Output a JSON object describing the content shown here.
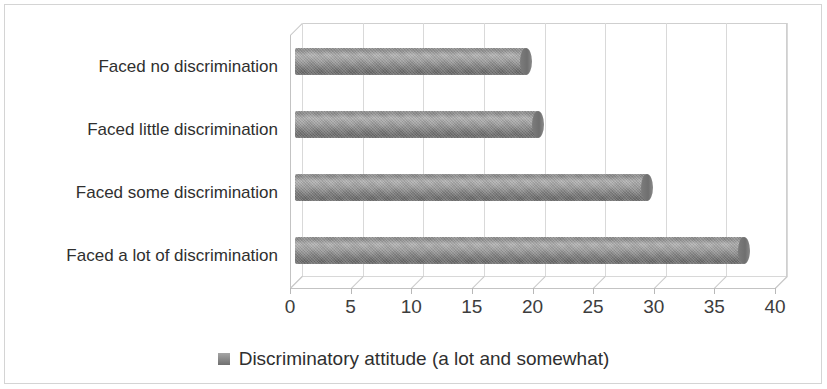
{
  "chart_data": {
    "type": "bar",
    "orientation": "horizontal",
    "title": "",
    "subtitle": "",
    "xlabel": "",
    "ylabel": "",
    "categories": [
      "Faced no discrimination",
      "Faced little discrimination",
      "Faced some discrimination",
      "Faced a lot of discrimination"
    ],
    "series": [
      {
        "name": "Discriminatory attitude (a lot and somewhat)",
        "values": [
          19,
          20,
          29,
          37
        ],
        "color": "#808080"
      }
    ],
    "xlim": [
      0,
      40
    ],
    "xticks": [
      0,
      5,
      10,
      15,
      20,
      25,
      30,
      35,
      40
    ],
    "xtick_labels": [
      "0",
      "5",
      "10",
      "15",
      "20",
      "25",
      "30",
      "35",
      "40"
    ],
    "grid": "vertical",
    "legend_position": "bottom",
    "style": "3d-cylinder"
  },
  "legend": {
    "entries": [
      {
        "label": "Discriminatory attitude (a lot and somewhat)",
        "swatch_name": "legend-swatch-discriminatory-attitude"
      }
    ]
  },
  "colors": {
    "bar": "#808080",
    "gridline": "#d9d9d9",
    "axis": "#c3c3c3",
    "text": "#2f2f2f",
    "frame": "#d4d4d4",
    "background": "#ffffff"
  }
}
